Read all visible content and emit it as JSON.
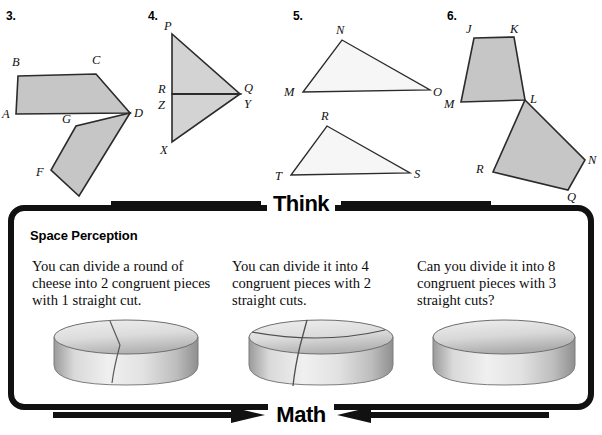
{
  "figures": [
    {
      "number": "3.",
      "shapes": "two shaded polygons joined at vertex D",
      "labels": [
        "A",
        "B",
        "C",
        "D",
        "E",
        "F",
        "G"
      ]
    },
    {
      "number": "4.",
      "shapes": "two shaded triangles sharing a horizontal edge",
      "labels": [
        "P",
        "Q",
        "R",
        "X",
        "Y",
        "Z"
      ]
    },
    {
      "number": "5.",
      "shapes": "two unshaded triangles",
      "labels": [
        "M",
        "N",
        "O",
        "R",
        "S",
        "T"
      ]
    },
    {
      "number": "6.",
      "shapes": "two shaded quadrilaterals joined at vertex L",
      "labels": [
        "J",
        "K",
        "L",
        "M",
        "N",
        "Q",
        "R"
      ]
    }
  ],
  "think_panel": {
    "header": "Think",
    "footer": "Math",
    "section_title": "Space Perception",
    "columns": [
      {
        "text": "You can divide a round of cheese into 2 congruent pieces with 1 straight cut.",
        "image": "cheese-wheel-one-cut",
        "cuts": 1
      },
      {
        "text": "You can divide it into 4 congruent pieces with 2 straight cuts.",
        "image": "cheese-wheel-two-cuts",
        "cuts": 2
      },
      {
        "text": "Can you divide it into 8 congruent pieces with 3 straight cuts?",
        "image": "cheese-wheel-no-cuts",
        "cuts": 0
      }
    ]
  },
  "colors": {
    "shaded_fill": "#c6c6c6",
    "light_fill": "#f2f2f2",
    "stroke": "#2b2b2b",
    "border": "#111111"
  }
}
